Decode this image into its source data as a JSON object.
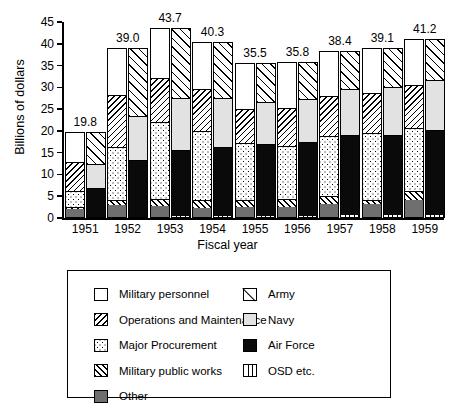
{
  "chart_data": {
    "type": "bar",
    "subtype": "paired-stacked-bar",
    "title": "",
    "xlabel": "Fiscal year",
    "ylabel": "Billions of dollars",
    "categories": [
      "1951",
      "1952",
      "1953",
      "1954",
      "1955",
      "1956",
      "1957",
      "1958",
      "1959"
    ],
    "ylim": [
      0,
      45
    ],
    "yticks": [
      0,
      5,
      10,
      15,
      20,
      25,
      30,
      35,
      40,
      45
    ],
    "grid": false,
    "legend_position": "bottom",
    "totals": [
      19.8,
      39.0,
      43.7,
      40.3,
      35.5,
      35.8,
      38.4,
      39.1,
      41.2
    ],
    "total_labels": [
      "19.8",
      "39.0",
      "43.7",
      "40.3",
      "35.5",
      "35.8",
      "38.4",
      "39.1",
      "41.2"
    ],
    "bar_groups": [
      {
        "name": "By function",
        "position": "left",
        "stack_order_bottom_to_top": [
          "Other",
          "Military public works",
          "Major Procurement",
          "Operations and Maintenance",
          "Military personnel"
        ],
        "series": [
          {
            "name": "Other",
            "values": [
              1.8,
              2.7,
              2.6,
              2.1,
              2.3,
              2.2,
              3.0,
              2.9,
              4.0
            ]
          },
          {
            "name": "Military public works",
            "values": [
              0.4,
              1.3,
              1.6,
              1.8,
              1.6,
              1.9,
              1.8,
              1.1,
              2.0
            ]
          },
          {
            "name": "Major Procurement",
            "values": [
              3.8,
              12.0,
              17.6,
              15.8,
              13.0,
              12.3,
              13.9,
              15.4,
              14.5
            ]
          },
          {
            "name": "Operations and Maintenance",
            "values": [
              6.6,
              11.9,
              10.2,
              9.6,
              8.0,
              8.7,
              9.0,
              9.1,
              9.9
            ]
          },
          {
            "name": "Military personnel",
            "values": [
              7.2,
              11.1,
              11.7,
              11.0,
              10.6,
              10.7,
              10.7,
              10.6,
              10.8
            ]
          }
        ]
      },
      {
        "name": "By service",
        "position": "right",
        "stack_order_bottom_to_top": [
          "OSD etc.",
          "Air Force",
          "Navy",
          "Army"
        ],
        "series": [
          {
            "name": "OSD etc.",
            "values": [
              0.0,
              0.0,
              0.2,
              0.3,
              0.3,
              0.3,
              0.4,
              0.4,
              0.5
            ]
          },
          {
            "name": "Air Force",
            "values": [
              6.6,
              13.0,
              15.3,
              15.7,
              16.5,
              16.9,
              18.4,
              18.4,
              19.4
            ]
          },
          {
            "name": "Navy",
            "values": [
              5.6,
              10.2,
              11.9,
              11.3,
              9.7,
              10.0,
              10.6,
              11.0,
              11.5
            ]
          },
          {
            "name": "Army",
            "values": [
              7.6,
              15.8,
              16.3,
              13.0,
              9.0,
              8.6,
              9.0,
              9.3,
              9.8
            ]
          }
        ]
      }
    ],
    "legend": {
      "column_left": [
        {
          "label": "Military personnel",
          "pattern": "solid-white"
        },
        {
          "label": "Operations and Maintenance",
          "pattern": "back-slash-hatch"
        },
        {
          "label": "Major Procurement",
          "pattern": "dotted"
        },
        {
          "label": "Military public works",
          "pattern": "forward-slash-hatch"
        },
        {
          "label": "Other",
          "pattern": "solid-dark-gray",
          "color": "#6f6f6f"
        }
      ],
      "column_right": [
        {
          "label": "Army",
          "pattern": "single-diagonal"
        },
        {
          "label": "Navy",
          "pattern": "solid-light-gray",
          "color": "#e2e2e2"
        },
        {
          "label": "Air Force",
          "pattern": "solid-black",
          "color": "#0a0a0a"
        },
        {
          "label": "OSD etc.",
          "pattern": "vertical-bars"
        }
      ]
    }
  }
}
